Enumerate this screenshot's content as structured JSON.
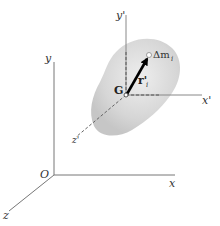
{
  "diagram": {
    "title": "",
    "labels": {
      "y_axis": "y",
      "x_axis": "x",
      "z_axis": "z",
      "origin": "O",
      "y_prime": "y'",
      "x_prime": "x'",
      "z_prime": "z'",
      "center_of_mass": "G",
      "mass_element": "Δm",
      "mass_element_sub": "i",
      "position_vector": "r'",
      "position_vector_sub": "i"
    },
    "colors": {
      "axis": "#666666",
      "body_fill": "#d9d9d9",
      "arrow": "#000000",
      "text": "#333333"
    }
  }
}
